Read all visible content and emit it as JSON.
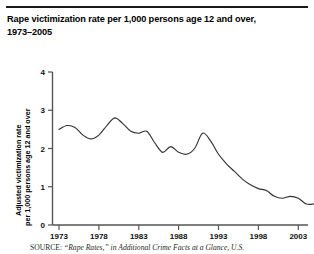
{
  "figure": {
    "title": "Rape victimization rate per 1,000 persons age 12 and over, 1973–2005",
    "title_line1": "Rape victimization rate per 1,000 persons age 12 and over,",
    "title_line2": "1973–2005",
    "source_label": "SOURCE:",
    "source_text": "“Rape Rates,” in Additional Crime Facts at a Glance, U.S.",
    "rule_color": "#1a1a1a",
    "line_color": "#333333",
    "axis_color": "#555555",
    "background": "#ffffff"
  },
  "chart_data": {
    "type": "line",
    "title": "Rape victimization rate per 1,000 persons age 12 and over, 1973–2005",
    "xlabel": "",
    "ylabel": "Adjusted victimization rate per 1,000 persons age 12 and over",
    "ylabel_line1": "Adjusted victimization rate",
    "ylabel_line2": "per 1,000 persons age 12 and over",
    "xlim": [
      1973,
      2005
    ],
    "ylim": [
      0,
      4
    ],
    "yticks": [
      0,
      1,
      2,
      3,
      4
    ],
    "ytick_labels": [
      "0",
      "1",
      "2",
      "3",
      "4"
    ],
    "xticks": [
      1973,
      1978,
      1983,
      1988,
      1993,
      1998,
      2003
    ],
    "xtick_labels": [
      "1973",
      "1978",
      "1983",
      "1988",
      "1993",
      "1998",
      "2003"
    ],
    "grid": false,
    "legend": false,
    "x": [
      1973,
      1974,
      1975,
      1976,
      1977,
      1978,
      1979,
      1980,
      1981,
      1982,
      1983,
      1984,
      1985,
      1986,
      1987,
      1988,
      1989,
      1990,
      1991,
      1992,
      1993,
      1994,
      1995,
      1996,
      1997,
      1998,
      1999,
      2000,
      2001,
      2002,
      2003,
      2004,
      2005
    ],
    "values": [
      2.5,
      2.6,
      2.55,
      2.35,
      2.25,
      2.35,
      2.6,
      2.8,
      2.65,
      2.45,
      2.4,
      2.45,
      2.15,
      1.9,
      2.05,
      1.9,
      1.85,
      2.0,
      2.4,
      2.2,
      1.85,
      1.6,
      1.4,
      1.2,
      1.05,
      0.95,
      0.9,
      0.75,
      0.7,
      0.75,
      0.7,
      0.55,
      0.55
    ]
  }
}
